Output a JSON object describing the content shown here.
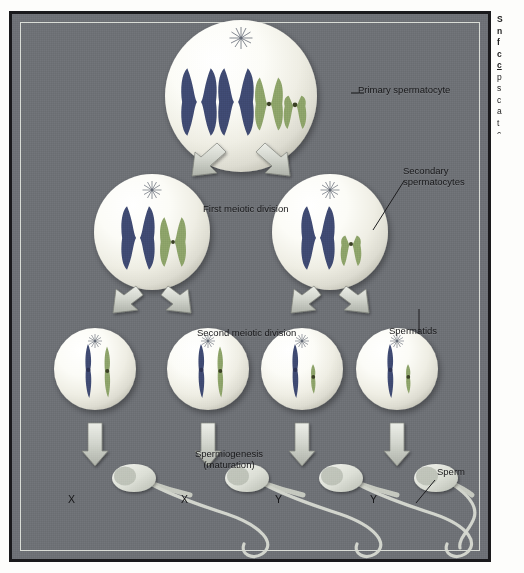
{
  "figure": {
    "background_color": "#6e7176",
    "frame_color": "#1a1a1c",
    "inner_rule_color": "#d9dcd6",
    "cell_fill": "#fdfdfa",
    "chromosome_colors": {
      "maternal_dark": "#3f4a72",
      "paternal_green": "#8aa06a",
      "centromere": "#2c3254"
    },
    "arrow_color": "#cfd2cb",
    "sperm_color": "#d7dad2"
  },
  "labels": {
    "primary_spermatocyte": "Primary spermatocyte",
    "secondary_spermatocytes": "Secondary\nspermatocytes",
    "secondary_line1": "Secondary",
    "secondary_line2": "spermatocytes",
    "first_meiotic_division": "First meiotic division",
    "second_meiotic_division": "Second meiotic division",
    "spermatids": "Spermatids",
    "spermiogenesis_line1": "Spermiogenesis",
    "spermiogenesis_line2": "(maturation)",
    "sperm": "Sperm"
  },
  "sperm_labels": [
    "X",
    "X",
    "Y",
    "Y"
  ],
  "stages": [
    {
      "name": "primary-spermatocyte",
      "count": 1,
      "chromosomes": [
        "X-dark",
        "X-dark",
        "X-green",
        "Y-green"
      ],
      "ploidy_note": "diploid, duplicated"
    },
    {
      "name": "secondary-spermatocyte-left",
      "count": 1,
      "chromosomes": [
        "X-dark",
        "X-green"
      ]
    },
    {
      "name": "secondary-spermatocyte-right",
      "count": 1,
      "chromosomes": [
        "X-dark",
        "Y-green"
      ]
    },
    {
      "name": "spermatids",
      "count": 4,
      "chromosomes_each": [
        [
          "X-dark-rod",
          "X-green-rod"
        ],
        [
          "X-dark-rod",
          "X-green-rod"
        ],
        [
          "X-dark-rod",
          "Y-green-rod"
        ],
        [
          "X-dark-rod",
          "Y-green-rod"
        ]
      ]
    },
    {
      "name": "sperm",
      "count": 4,
      "sex_chromosome": [
        "X",
        "X",
        "Y",
        "Y"
      ]
    }
  ],
  "margin_caption": {
    "lines": [
      "S",
      "n",
      "f",
      "c",
      "c",
      "p",
      "s",
      "c",
      "a",
      "t",
      "c"
    ]
  }
}
